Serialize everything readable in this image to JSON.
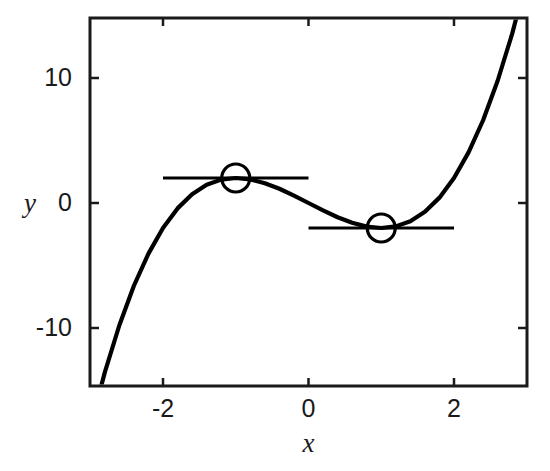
{
  "chart_data": {
    "type": "line",
    "title": "",
    "subtitle": "",
    "xlabel": "x",
    "ylabel": "y",
    "xlim": [
      -3.0,
      3.0
    ],
    "ylim": [
      -18.0,
      15.0
    ],
    "xticks": [
      -2,
      0,
      2
    ],
    "xticklabels": [
      "-2",
      "0",
      "2"
    ],
    "yticks": [
      10,
      0,
      -10
    ],
    "yticklabels": [
      "10",
      "0",
      "-10"
    ],
    "grid": false,
    "legend": false,
    "series": [
      {
        "name": "y = x^3 - 3x",
        "kind": "curve",
        "color": "#000000",
        "x": [
          -3.0,
          -2.8,
          -2.6,
          -2.4,
          -2.2,
          -2.0,
          -1.8,
          -1.6,
          -1.4,
          -1.2,
          -1.0,
          -0.8,
          -0.6,
          -0.4,
          -0.2,
          0.0,
          0.2,
          0.4,
          0.6,
          0.8,
          1.0,
          1.2,
          1.4,
          1.6,
          1.8,
          2.0,
          2.2,
          2.4,
          2.6,
          2.8,
          3.0
        ],
        "y": [
          -18.0,
          -13.55,
          -9.78,
          -6.62,
          -4.05,
          -2.0,
          -0.43,
          0.7,
          1.46,
          1.87,
          2.0,
          1.89,
          1.58,
          1.14,
          0.59,
          0.0,
          -0.59,
          -1.14,
          -1.58,
          -1.89,
          -2.0,
          -1.87,
          -1.46,
          -0.7,
          0.43,
          2.0,
          4.05,
          6.62,
          9.78,
          13.55,
          18.0
        ]
      },
      {
        "name": "tangent-at-local-maximum",
        "kind": "horizontal-segment",
        "color": "#000000",
        "y": 2.0,
        "x_start": -2.0,
        "x_end": 0.0
      },
      {
        "name": "tangent-at-local-minimum",
        "kind": "horizontal-segment",
        "color": "#000000",
        "y": -2.0,
        "x_start": 0.0,
        "x_end": 2.0
      }
    ],
    "markers": [
      {
        "name": "local-maximum",
        "x": -1.0,
        "y": 2.0,
        "shape": "open-circle",
        "radius_px": 14,
        "edge_color": "#000000",
        "face_color": "#ffffff"
      },
      {
        "name": "local-minimum",
        "x": 1.0,
        "y": -2.0,
        "shape": "open-circle",
        "radius_px": 14,
        "edge_color": "#000000",
        "face_color": "#ffffff"
      }
    ],
    "annotations": []
  },
  "axes": {
    "frame_color": "#1a1a1a",
    "background": "#ffffff",
    "x_axis_label": "x",
    "y_axis_label": "y",
    "x_tick_labels": [
      "-2",
      "0",
      "2"
    ],
    "y_tick_labels": [
      "10",
      "0",
      "-10"
    ]
  }
}
